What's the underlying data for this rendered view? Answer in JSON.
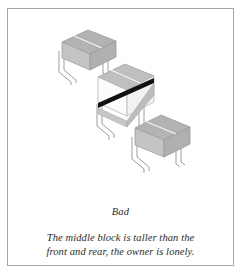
{
  "figure": {
    "label": "Bad",
    "caption_lines": [
      "The middle block is taller than the",
      "front and rear, the owner is lonely."
    ],
    "illustration": {
      "type": "isometric-blocks-diagram",
      "block_count": 3,
      "arrangement": "diagonal-from-upper-left-to-lower-right",
      "blocks": [
        {
          "name": "rear-block",
          "position": "upper-left",
          "height_relative": "short",
          "body_color": "#b5b5b5",
          "top_color": "#b0b0b0",
          "side_color": "#c9c9c9",
          "leg_color": "#9a9a9a",
          "leg_count": 3
        },
        {
          "name": "middle-block",
          "position": "center",
          "height_relative": "tall",
          "body_color": "#fdfdfd",
          "top_color": "#bdbdbd",
          "side_color": "#e6e6e6",
          "band_color": "#111111",
          "leg_color": "#9a9a9a",
          "leg_count": 3
        },
        {
          "name": "front-block",
          "position": "lower-right",
          "height_relative": "short",
          "body_color": "#b5b5b5",
          "top_color": "#b0b0b0",
          "side_color": "#c9c9c9",
          "leg_color": "#9a9a9a",
          "leg_count": 3
        }
      ],
      "background_color": "#ffffff",
      "frame_border_color": "#a6a6a6"
    }
  }
}
